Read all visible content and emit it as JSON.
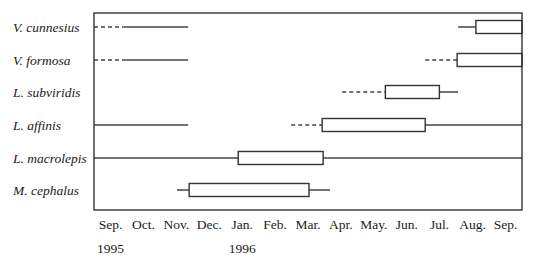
{
  "chart_data": {
    "type": "gantt-range",
    "title": "",
    "xlabel": "",
    "ylabel": "",
    "x_axis": {
      "unit": "month index (0 = start of Sep 1995, 13 = end of Sep 1996)",
      "range": [
        0,
        13
      ],
      "tick_labels": [
        "Sep.",
        "Oct.",
        "Nov.",
        "Dec.",
        "Jan.",
        "Feb.",
        "Mar.",
        "Apr.",
        "May.",
        "Jun.",
        "Jul.",
        "Aug.",
        "Sep."
      ],
      "year_labels": [
        {
          "text": "1995",
          "month_index": 0
        },
        {
          "text": "1996",
          "month_index": 4
        }
      ]
    },
    "legend": "none",
    "grid": false,
    "species": [
      {
        "name": "V. cunnesius",
        "segments": [
          {
            "style": "dashed",
            "start": 0,
            "end": 0.9
          },
          {
            "style": "solid",
            "start": 0.9,
            "end": 2.86
          },
          {
            "style": "solid",
            "start": 11.06,
            "end": 11.6
          },
          {
            "style": "box",
            "start": 11.6,
            "end": 13
          }
        ]
      },
      {
        "name": "V. formosa",
        "segments": [
          {
            "style": "dashed",
            "start": 0,
            "end": 0.9
          },
          {
            "style": "solid",
            "start": 0.9,
            "end": 2.86
          },
          {
            "style": "dashed",
            "start": 10.06,
            "end": 11.03
          },
          {
            "style": "box",
            "start": 11.03,
            "end": 13
          }
        ]
      },
      {
        "name": "L. subviridis",
        "segments": [
          {
            "style": "dashed",
            "start": 7.54,
            "end": 8.85
          },
          {
            "style": "box",
            "start": 8.85,
            "end": 10.49
          },
          {
            "style": "solid",
            "start": 10.49,
            "end": 11.06
          }
        ]
      },
      {
        "name": "L. affinis",
        "segments": [
          {
            "style": "solid",
            "start": 0,
            "end": 2.86
          },
          {
            "style": "dashed",
            "start": 5.99,
            "end": 6.93
          },
          {
            "style": "box",
            "start": 6.93,
            "end": 10.06
          },
          {
            "style": "solid",
            "start": 10.06,
            "end": 13
          }
        ]
      },
      {
        "name": "L. macrolepis",
        "segments": [
          {
            "style": "solid",
            "start": 0,
            "end": 4.38
          },
          {
            "style": "box",
            "start": 4.38,
            "end": 6.96
          },
          {
            "style": "solid",
            "start": 6.96,
            "end": 13
          }
        ]
      },
      {
        "name": "M. cephalus",
        "segments": [
          {
            "style": "solid",
            "start": 2.52,
            "end": 2.89
          },
          {
            "style": "box",
            "start": 2.89,
            "end": 6.53
          },
          {
            "style": "solid",
            "start": 6.53,
            "end": 7.17
          }
        ]
      }
    ]
  }
}
